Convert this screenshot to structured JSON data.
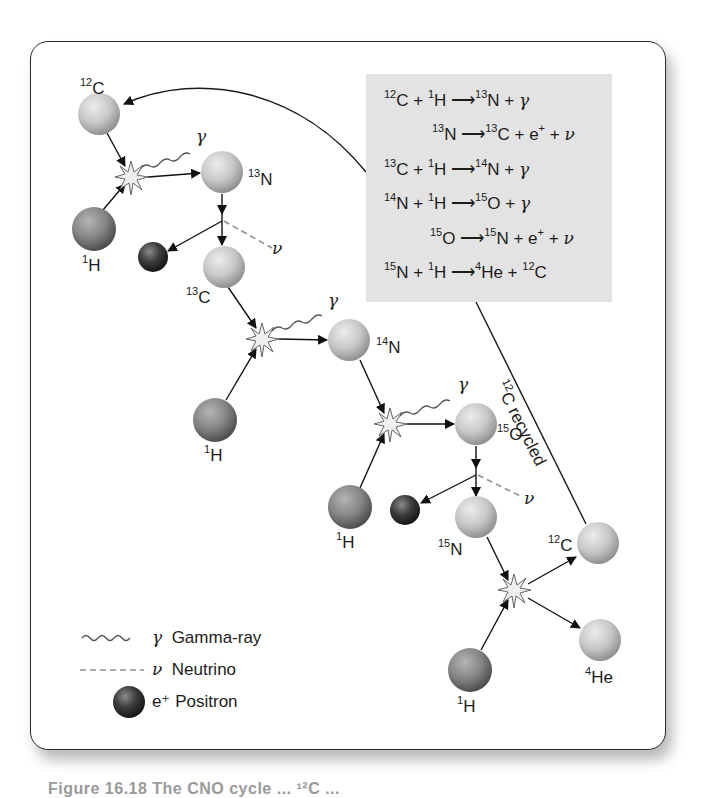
{
  "diagram": {
    "title": "CNO cycle",
    "equations": [
      {
        "id": "eq1",
        "text": "¹²C + ¹H → ¹³N + γ",
        "parts": [
          [
            "sup",
            "12"
          ],
          [
            "t",
            "C + "
          ],
          [
            "sup",
            "1"
          ],
          [
            "t",
            "H "
          ],
          [
            "arrow",
            ""
          ],
          [
            "sup",
            "13"
          ],
          [
            "t",
            "N + "
          ],
          [
            "g",
            "γ"
          ]
        ]
      },
      {
        "id": "eq2",
        "text": "¹³N → ¹³C + e⁺ + ν"
      },
      {
        "id": "eq3",
        "text": "¹³C + ¹H → ¹⁴N + γ"
      },
      {
        "id": "eq4",
        "text": "¹⁴N + ¹H → ¹⁵O + γ"
      },
      {
        "id": "eq5",
        "text": "¹⁵O → ¹⁵N + e⁺ + ν"
      },
      {
        "id": "eq6",
        "text": "¹⁵N + ¹H → ⁴He + ¹²C"
      }
    ],
    "nuclei_labels": {
      "c12_in": {
        "mass": "12",
        "sym": "C"
      },
      "h1_a": {
        "mass": "1",
        "sym": "H"
      },
      "n13": {
        "mass": "13",
        "sym": "N"
      },
      "c13": {
        "mass": "13",
        "sym": "C"
      },
      "h1_b": {
        "mass": "1",
        "sym": "H"
      },
      "n14": {
        "mass": "14",
        "sym": "N"
      },
      "h1_c": {
        "mass": "1",
        "sym": "H"
      },
      "o15": {
        "mass": "15",
        "sym": "O"
      },
      "n15": {
        "mass": "15",
        "sym": "N"
      },
      "h1_d": {
        "mass": "1",
        "sym": "H"
      },
      "c12_out": {
        "mass": "12",
        "sym": "C"
      },
      "he4": {
        "mass": "4",
        "sym": "He"
      }
    },
    "gamma_symbol": "γ",
    "neutrino_symbol": "ν",
    "recycle_label": {
      "mass": "12",
      "text": "C recycled"
    },
    "legend": [
      {
        "symbol": "γ",
        "label": "Gamma-ray",
        "icon": "wavy-line"
      },
      {
        "symbol": "ν",
        "label": "Neutrino",
        "icon": "dashed-line"
      },
      {
        "symbol": "e⁺",
        "label": "Positron",
        "icon": "dark-sphere"
      }
    ],
    "caption": "Figure 16.18  The CNO cycle ... ¹²C ...",
    "colors": {
      "light_nucleus": "#c9c9c9",
      "hydrogen": "#8a8a8a",
      "positron": "#3a3a3a",
      "equation_box": "#e3e3e3",
      "neutrino_dash": "#909090",
      "line": "#1a1a1a"
    }
  }
}
